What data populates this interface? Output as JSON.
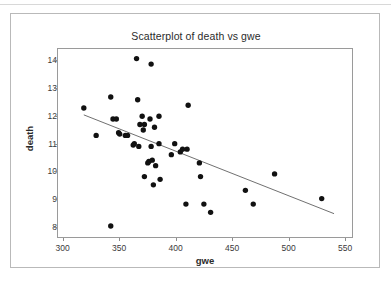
{
  "chart_data": {
    "type": "scatter",
    "title": "Scatterplot of death vs gwe",
    "xlabel": "gwe",
    "ylabel": "death",
    "xlim": [
      295,
      557
    ],
    "ylim": [
      7.6,
      14.45
    ],
    "xticks": [
      300,
      350,
      400,
      450,
      500,
      550
    ],
    "yticks": [
      8,
      9,
      10,
      11,
      12,
      13,
      14
    ],
    "grid": false,
    "legend": null,
    "points": [
      {
        "x": 318,
        "y": 12.3
      },
      {
        "x": 329,
        "y": 11.3
      },
      {
        "x": 342,
        "y": 12.7
      },
      {
        "x": 342,
        "y": 8.0
      },
      {
        "x": 344,
        "y": 11.9
      },
      {
        "x": 347,
        "y": 11.9
      },
      {
        "x": 349,
        "y": 11.4
      },
      {
        "x": 350,
        "y": 11.35
      },
      {
        "x": 355,
        "y": 11.3
      },
      {
        "x": 357,
        "y": 11.3
      },
      {
        "x": 362,
        "y": 10.95
      },
      {
        "x": 363,
        "y": 11.0
      },
      {
        "x": 365,
        "y": 14.1
      },
      {
        "x": 366,
        "y": 12.6
      },
      {
        "x": 367,
        "y": 10.9
      },
      {
        "x": 368,
        "y": 11.7
      },
      {
        "x": 370,
        "y": 12.0
      },
      {
        "x": 371,
        "y": 11.5
      },
      {
        "x": 372,
        "y": 11.7
      },
      {
        "x": 372,
        "y": 9.8
      },
      {
        "x": 375,
        "y": 10.3
      },
      {
        "x": 376,
        "y": 10.35
      },
      {
        "x": 377,
        "y": 11.9
      },
      {
        "x": 378,
        "y": 13.9
      },
      {
        "x": 378,
        "y": 10.9
      },
      {
        "x": 379,
        "y": 10.4
      },
      {
        "x": 380,
        "y": 9.5
      },
      {
        "x": 381,
        "y": 11.6
      },
      {
        "x": 382,
        "y": 10.2
      },
      {
        "x": 385,
        "y": 12.0
      },
      {
        "x": 385,
        "y": 11.0
      },
      {
        "x": 386,
        "y": 9.7
      },
      {
        "x": 396,
        "y": 10.6
      },
      {
        "x": 399,
        "y": 11.0
      },
      {
        "x": 404,
        "y": 10.7
      },
      {
        "x": 406,
        "y": 10.8
      },
      {
        "x": 409,
        "y": 8.8
      },
      {
        "x": 410,
        "y": 10.8
      },
      {
        "x": 411,
        "y": 12.4
      },
      {
        "x": 421,
        "y": 10.3
      },
      {
        "x": 422,
        "y": 9.8
      },
      {
        "x": 425,
        "y": 8.8
      },
      {
        "x": 431,
        "y": 8.5
      },
      {
        "x": 462,
        "y": 9.3
      },
      {
        "x": 469,
        "y": 8.8
      },
      {
        "x": 488,
        "y": 9.9
      },
      {
        "x": 530,
        "y": 9.0
      }
    ],
    "fit_line": {
      "x_start": 318,
      "y_start": 12.05,
      "x_end": 541,
      "y_end": 8.45
    },
    "marker": {
      "shape": "filled-circle",
      "color": "#111111",
      "size": 3.6
    },
    "line_color": "#6e6e6e",
    "frame_color": "#9a9a9a",
    "background": "#ffffff"
  }
}
